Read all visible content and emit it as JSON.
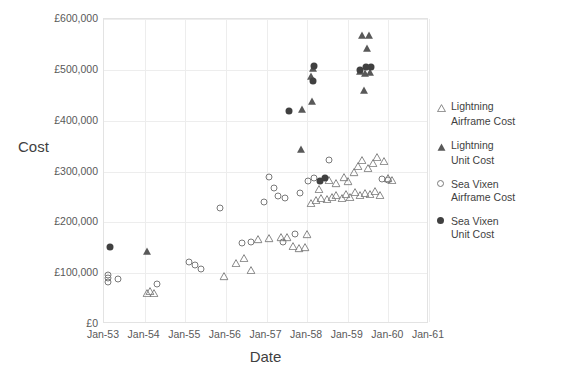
{
  "chart_data": {
    "type": "scatter",
    "title": "",
    "xlabel": "Date",
    "ylabel": "Cost",
    "grid": true,
    "legend_position": "right",
    "xlim": [
      "Jan-53",
      "Jan-61"
    ],
    "ylim": [
      0,
      600000
    ],
    "x_tick_labels": [
      "Jan-53",
      "Jan-54",
      "Jan-55",
      "Jan-56",
      "Jan-57",
      "Jan-58",
      "Jan-59",
      "Jan-60",
      "Jan-61"
    ],
    "y_tick_labels": [
      "£0",
      "£100,000",
      "£200,000",
      "£300,000",
      "£400,000",
      "£500,000",
      "£600,000"
    ],
    "y_tick_values": [
      0,
      100000,
      200000,
      300000,
      400000,
      500000,
      600000
    ],
    "series": [
      {
        "name": "Lightning Airframe Cost",
        "marker": "triangle-open",
        "color": "#7a7a7a",
        "points": [
          {
            "x": 1954.05,
            "y": 62000
          },
          {
            "x": 1954.12,
            "y": 66000
          },
          {
            "x": 1954.22,
            "y": 63000
          },
          {
            "x": 1955.95,
            "y": 95000
          },
          {
            "x": 1956.25,
            "y": 122000
          },
          {
            "x": 1956.45,
            "y": 132000
          },
          {
            "x": 1956.8,
            "y": 168000
          },
          {
            "x": 1957.05,
            "y": 170000
          },
          {
            "x": 1957.35,
            "y": 172000
          },
          {
            "x": 1957.65,
            "y": 155000
          },
          {
            "x": 1957.8,
            "y": 150000
          },
          {
            "x": 1957.95,
            "y": 152000
          },
          {
            "x": 1958.1,
            "y": 240000
          },
          {
            "x": 1958.22,
            "y": 245000
          },
          {
            "x": 1958.35,
            "y": 250000
          },
          {
            "x": 1958.48,
            "y": 248000
          },
          {
            "x": 1958.6,
            "y": 252000
          },
          {
            "x": 1958.72,
            "y": 255000
          },
          {
            "x": 1958.85,
            "y": 250000
          },
          {
            "x": 1958.95,
            "y": 258000
          },
          {
            "x": 1959.05,
            "y": 252000
          },
          {
            "x": 1959.18,
            "y": 262000
          },
          {
            "x": 1959.3,
            "y": 256000
          },
          {
            "x": 1959.42,
            "y": 260000
          },
          {
            "x": 1959.55,
            "y": 258000
          },
          {
            "x": 1959.68,
            "y": 264000
          },
          {
            "x": 1959.8,
            "y": 255000
          },
          {
            "x": 1958.55,
            "y": 285000
          },
          {
            "x": 1958.7,
            "y": 278000
          },
          {
            "x": 1959.15,
            "y": 300000
          },
          {
            "x": 1959.25,
            "y": 312000
          },
          {
            "x": 1959.35,
            "y": 325000
          },
          {
            "x": 1959.5,
            "y": 308000
          },
          {
            "x": 1959.62,
            "y": 318000
          },
          {
            "x": 1959.72,
            "y": 330000
          },
          {
            "x": 1959.88,
            "y": 322000
          },
          {
            "x": 1960.0,
            "y": 288000
          },
          {
            "x": 1960.08,
            "y": 285000
          },
          {
            "x": 1958.0,
            "y": 178000
          },
          {
            "x": 1957.5,
            "y": 172000
          },
          {
            "x": 1956.62,
            "y": 108000
          },
          {
            "x": 1958.9,
            "y": 290000
          },
          {
            "x": 1959.0,
            "y": 282000
          },
          {
            "x": 1958.3,
            "y": 268000
          }
        ]
      },
      {
        "name": "Lightning Unit Cost",
        "marker": "triangle-filled",
        "color": "#595959",
        "points": [
          {
            "x": 1954.05,
            "y": 145000
          },
          {
            "x": 1957.85,
            "y": 345000
          },
          {
            "x": 1958.1,
            "y": 490000
          },
          {
            "x": 1958.12,
            "y": 440000
          },
          {
            "x": 1958.15,
            "y": 505000
          },
          {
            "x": 1959.35,
            "y": 570000
          },
          {
            "x": 1959.52,
            "y": 570000
          },
          {
            "x": 1959.48,
            "y": 545000
          },
          {
            "x": 1959.3,
            "y": 500000
          },
          {
            "x": 1959.42,
            "y": 495000
          },
          {
            "x": 1959.55,
            "y": 498000
          },
          {
            "x": 1959.4,
            "y": 462000
          },
          {
            "x": 1957.88,
            "y": 425000
          }
        ]
      },
      {
        "name": "Sea Vixen Airframe Cost",
        "marker": "circle-open",
        "color": "#7a7a7a",
        "points": [
          {
            "x": 1953.1,
            "y": 82000
          },
          {
            "x": 1953.1,
            "y": 90000
          },
          {
            "x": 1953.1,
            "y": 97000
          },
          {
            "x": 1953.35,
            "y": 88000
          },
          {
            "x": 1954.3,
            "y": 78000
          },
          {
            "x": 1955.1,
            "y": 122000
          },
          {
            "x": 1955.25,
            "y": 116000
          },
          {
            "x": 1955.38,
            "y": 108000
          },
          {
            "x": 1955.85,
            "y": 228000
          },
          {
            "x": 1956.4,
            "y": 160000
          },
          {
            "x": 1956.62,
            "y": 162000
          },
          {
            "x": 1957.05,
            "y": 290000
          },
          {
            "x": 1957.18,
            "y": 268000
          },
          {
            "x": 1957.45,
            "y": 248000
          },
          {
            "x": 1957.4,
            "y": 162000
          },
          {
            "x": 1957.7,
            "y": 178000
          },
          {
            "x": 1957.82,
            "y": 258000
          },
          {
            "x": 1958.02,
            "y": 282000
          },
          {
            "x": 1958.18,
            "y": 288000
          },
          {
            "x": 1958.55,
            "y": 322000
          },
          {
            "x": 1959.85,
            "y": 285000
          },
          {
            "x": 1960.0,
            "y": 283000
          },
          {
            "x": 1956.95,
            "y": 240000
          },
          {
            "x": 1957.28,
            "y": 252000
          }
        ]
      },
      {
        "name": "Sea Vixen Unit Cost",
        "marker": "circle-filled",
        "color": "#404040",
        "points": [
          {
            "x": 1953.15,
            "y": 152000
          },
          {
            "x": 1957.55,
            "y": 420000
          },
          {
            "x": 1958.15,
            "y": 478000
          },
          {
            "x": 1958.18,
            "y": 508000
          },
          {
            "x": 1959.45,
            "y": 505000
          },
          {
            "x": 1959.58,
            "y": 505000
          },
          {
            "x": 1958.32,
            "y": 282000
          },
          {
            "x": 1958.45,
            "y": 288000
          },
          {
            "x": 1959.3,
            "y": 500000
          }
        ]
      }
    ]
  },
  "legend": {
    "entries": [
      {
        "glyph": "triangle-open-icon",
        "line1": "Lightning",
        "line2": "Airframe Cost"
      },
      {
        "glyph": "triangle-filled-icon",
        "line1": "Lightning",
        "line2": "Unit Cost"
      },
      {
        "glyph": "circle-open-icon",
        "line1": "Sea Vixen",
        "line2": "Airframe Cost"
      },
      {
        "glyph": "circle-filled-icon",
        "line1": "Sea Vixen",
        "line2": "Unit Cost"
      }
    ]
  },
  "colors": {
    "grid": "#ededed",
    "frame": "#e3e3e3",
    "tick_text": "#595959",
    "title_text": "#3f3f3f",
    "open_marker": "#7a7a7a",
    "filled_marker": "#404040"
  }
}
